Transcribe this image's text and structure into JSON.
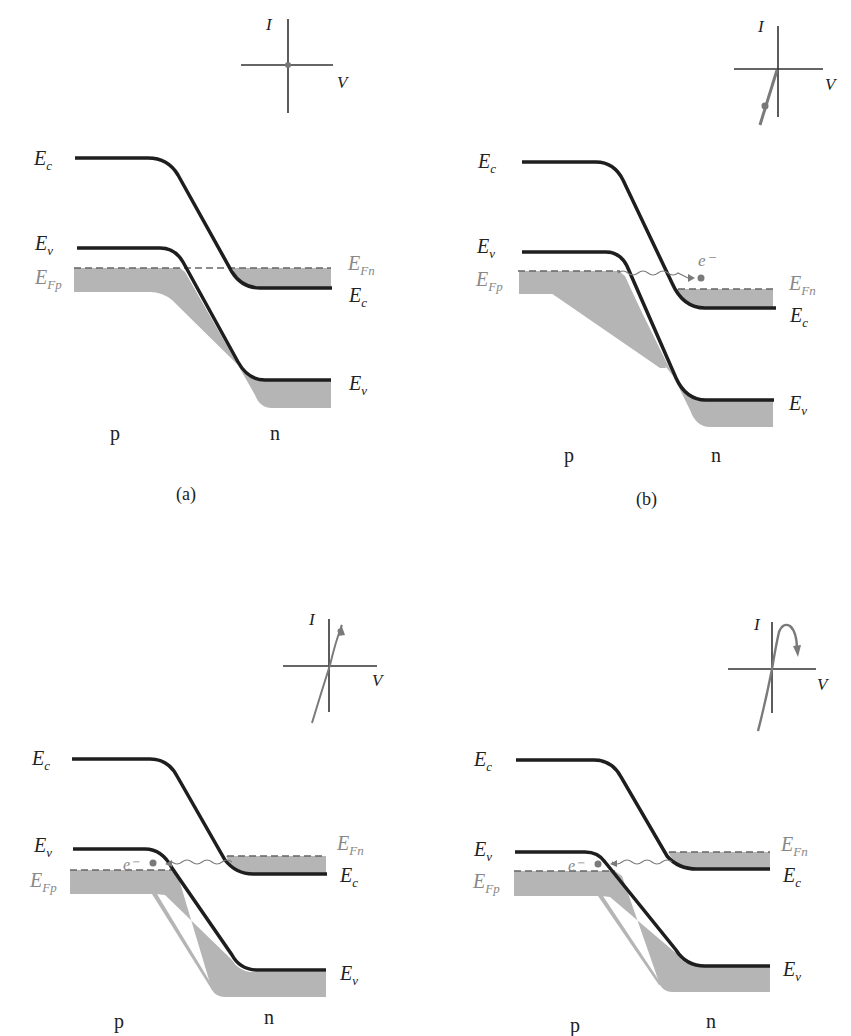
{
  "colors": {
    "band_line": "#1e1e1e",
    "fill": "#b4b4b4",
    "fermi_dash": "#666666",
    "accent_gray": "#7a7a7a",
    "axis": "#333333"
  },
  "panels": [
    {
      "id": "a",
      "caption": "(a)",
      "labels": {
        "Ec_left": "E",
        "Ec_left_sub": "c",
        "Ev_left": "E",
        "Ev_left_sub": "v",
        "EFp": "E",
        "EFp_sub": "Fp",
        "EFn": "E",
        "EFn_sub": "Fn",
        "Ec_right": "E",
        "Ec_right_sub": "c",
        "Ev_right": "E",
        "Ev_right_sub": "v",
        "p": "p",
        "n": "n",
        "I": "I",
        "V": "V",
        "electron": ""
      },
      "iv_state": "zero bias, operating point at origin"
    },
    {
      "id": "b",
      "caption": "(b)",
      "labels": {
        "Ec_left": "E",
        "Ec_left_sub": "c",
        "Ev_left": "E",
        "Ev_left_sub": "v",
        "EFp": "E",
        "EFp_sub": "Fp",
        "EFn": "E",
        "EFn_sub": "Fn",
        "Ec_right": "E",
        "Ec_right_sub": "c",
        "Ev_right": "E",
        "Ev_right_sub": "v",
        "p": "p",
        "n": "n",
        "I": "I",
        "V": "V",
        "electron": "e⁻"
      },
      "iv_state": "reverse bias, tunneling current negative"
    },
    {
      "id": "c",
      "caption": "",
      "labels": {
        "Ec_left": "E",
        "Ec_left_sub": "c",
        "Ev_left": "E",
        "Ev_left_sub": "v",
        "EFp": "E",
        "EFp_sub": "Fp",
        "EFn": "E",
        "EFn_sub": "Fn",
        "Ec_right": "E",
        "Ec_right_sub": "c",
        "Ev_right": "E",
        "Ev_right_sub": "v",
        "p": "p",
        "n": "n",
        "I": "I",
        "V": "V",
        "electron": "e⁻"
      },
      "iv_state": "small forward bias, tunneling current rising"
    },
    {
      "id": "d",
      "caption": "",
      "labels": {
        "Ec_left": "E",
        "Ec_left_sub": "c",
        "Ev_left": "E",
        "Ev_left_sub": "v",
        "EFp": "E",
        "EFp_sub": "Fp",
        "EFn": "E",
        "EFn_sub": "Fn",
        "Ec_right": "E",
        "Ec_right_sub": "c",
        "Ev_right": "E",
        "Ev_right_sub": "v",
        "p": "p",
        "n": "n",
        "I": "I",
        "V": "V",
        "electron": "e⁻"
      },
      "iv_state": "forward bias past peak, negative differential resistance"
    }
  ]
}
